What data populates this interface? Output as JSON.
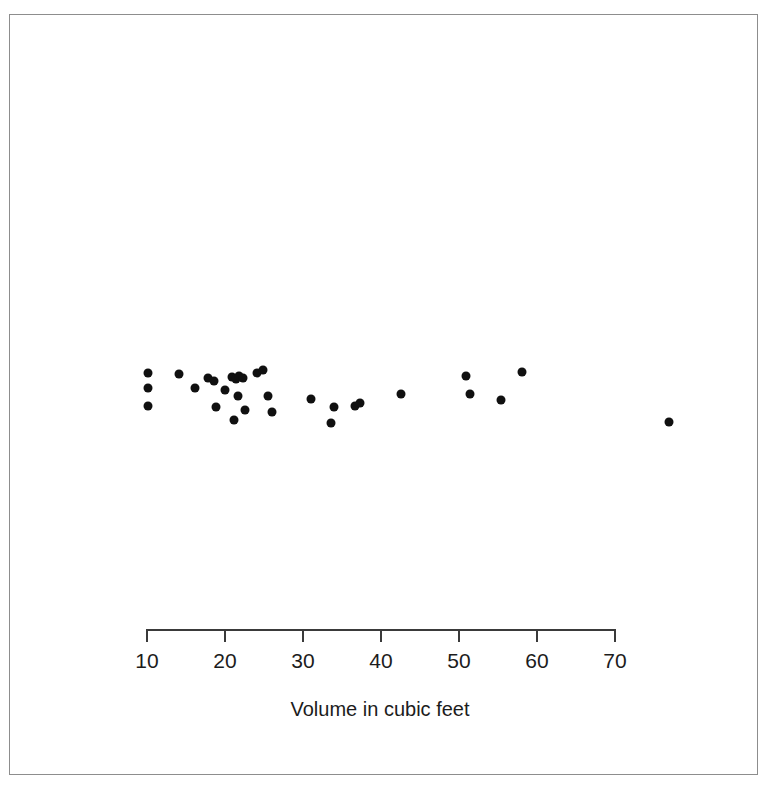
{
  "figure": {
    "background_color": "#ffffff",
    "frame_color": "#8d8d8d",
    "point_color": "#101010",
    "axis_color": "#3a3a3a",
    "text_color": "#1c1c1c"
  },
  "axis": {
    "title": "Volume in cubic feet",
    "tick_labels": [
      "10",
      "20",
      "30",
      "40",
      "50",
      "60",
      "70"
    ],
    "tick_values": [
      10,
      20,
      30,
      40,
      50,
      60,
      70
    ]
  },
  "chart_data": {
    "type": "scatter",
    "title": "",
    "subtitle": "",
    "xlabel": "Volume in cubic feet",
    "ylabel": "",
    "xlim": [
      10,
      70
    ],
    "ylim": [
      0,
      1
    ],
    "grid": false,
    "legend": false,
    "legend_position": "none",
    "note": "One-dimensional strip/jitter plot: vertical positions are random jitter used to separate overlapping observations; only the x value (volume) carries meaning.",
    "x": [
      10.3,
      10.3,
      10.3,
      14.2,
      16.3,
      18.0,
      18.7,
      19.0,
      20.1,
      21.0,
      21.3,
      21.6,
      21.9,
      21.8,
      22.4,
      22.7,
      24.2,
      25.0,
      25.6,
      26.2,
      31.2,
      33.7,
      34.1,
      36.8,
      37.4,
      42.7,
      51.0,
      51.6,
      55.5,
      58.2,
      77.0
    ],
    "y_jitter": [
      0.57,
      0.44,
      0.27,
      0.56,
      0.44,
      0.53,
      0.5,
      0.26,
      0.42,
      0.54,
      0.15,
      0.52,
      0.55,
      0.36,
      0.53,
      0.24,
      0.57,
      0.6,
      0.36,
      0.22,
      0.34,
      0.12,
      0.26,
      0.27,
      0.3,
      0.38,
      0.55,
      0.38,
      0.33,
      0.58,
      0.13
    ],
    "series": [
      {
        "name": "Tree volume observations",
        "values": [
          10.3,
          10.3,
          10.3,
          14.2,
          16.3,
          18.0,
          18.7,
          19.0,
          20.1,
          21.0,
          21.3,
          21.6,
          21.9,
          21.8,
          22.4,
          22.7,
          24.2,
          25.0,
          25.6,
          26.2,
          31.2,
          33.7,
          34.1,
          36.8,
          37.4,
          42.7,
          51.0,
          51.6,
          55.5,
          58.2,
          77.0
        ]
      }
    ],
    "n_points": 31,
    "units": "cubic feet"
  }
}
